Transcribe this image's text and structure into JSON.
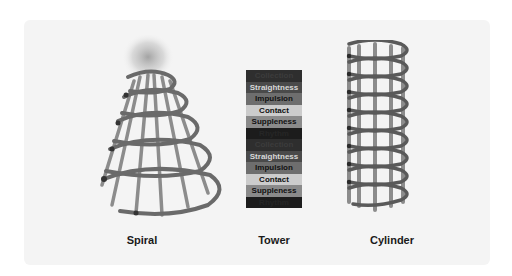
{
  "figures": [
    {
      "id": "spiral",
      "label": "Spiral"
    },
    {
      "id": "tower",
      "label": "Tower"
    },
    {
      "id": "cylinder",
      "label": "Cylinder"
    }
  ],
  "tower": {
    "rows": [
      {
        "label": "Collection",
        "bg": "#2e2e2e",
        "fg": "#3c3c3c"
      },
      {
        "label": "Straightness",
        "bg": "#4a4a4a",
        "fg": "#d8d8d8"
      },
      {
        "label": "Impulsion",
        "bg": "#6e6e6e",
        "fg": "#111111"
      },
      {
        "label": "Contact",
        "bg": "#cccccc",
        "fg": "#111111"
      },
      {
        "label": "Suppleness",
        "bg": "#8a8a8a",
        "fg": "#111111"
      },
      {
        "label": "Rhythm",
        "bg": "#1c1c1c",
        "fg": "#262626"
      },
      {
        "label": "Collection",
        "bg": "#2e2e2e",
        "fg": "#3c3c3c"
      },
      {
        "label": "Straightness",
        "bg": "#4a4a4a",
        "fg": "#d8d8d8"
      },
      {
        "label": "Impulsion",
        "bg": "#6e6e6e",
        "fg": "#111111"
      },
      {
        "label": "Contact",
        "bg": "#cccccc",
        "fg": "#111111"
      },
      {
        "label": "Suppleness",
        "bg": "#8a8a8a",
        "fg": "#111111"
      },
      {
        "label": "Rhythm",
        "bg": "#1c1c1c",
        "fg": "#262626"
      }
    ]
  },
  "colors": {
    "background": "#ffffff",
    "card": "#f4f4f4",
    "ring": "#6a6a6a",
    "strut": "#7a7a7a"
  }
}
